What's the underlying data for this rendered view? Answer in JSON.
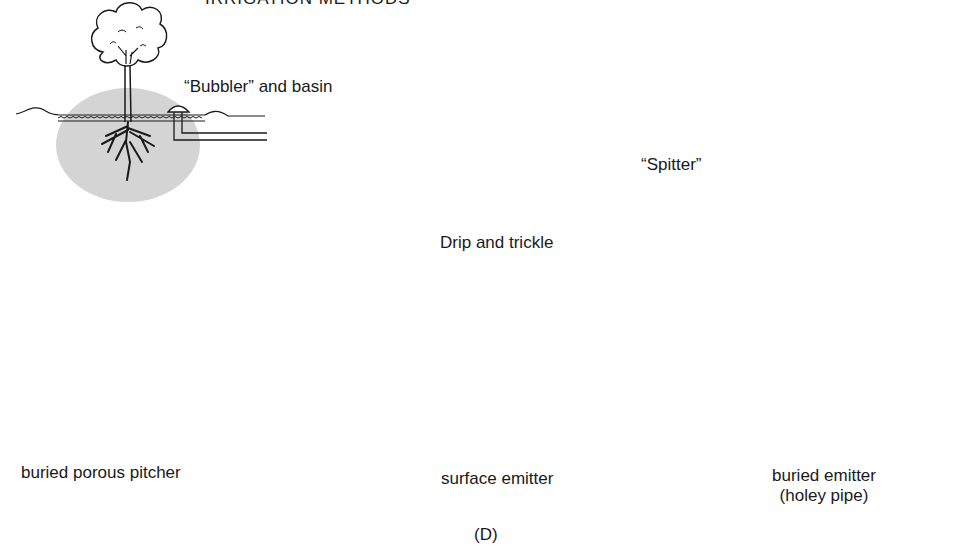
{
  "figure": {
    "title_partial": "IRRIGATION METHODS",
    "panel_label": "(D)",
    "colors": {
      "soil_zone": "#d4d4d4",
      "line": "#1a1a1a",
      "pitcher_wall": "#8a8a8a",
      "background": "#ffffff"
    }
  },
  "methods": [
    {
      "id": "bubbler",
      "label": "“Bubbler” and basin",
      "icon": "tree-with-bubbler-icon"
    },
    {
      "id": "spitter",
      "label": "“Spitter”",
      "icon": "tree-with-spitter-icon"
    },
    {
      "id": "pitcher",
      "label": "buried porous pitcher",
      "icon": "porous-pitcher-icon"
    },
    {
      "id": "drip_group",
      "label": "Drip and trickle"
    },
    {
      "id": "surface_emitter",
      "label": "surface emitter",
      "icon": "tree-surface-emitter-icon"
    },
    {
      "id": "buried_emitter",
      "label_line1": "buried emitter",
      "label_line2": "(holey pipe)",
      "icon": "tree-buried-emitter-icon"
    }
  ]
}
